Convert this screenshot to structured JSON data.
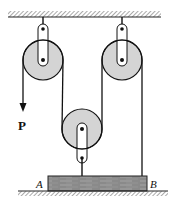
{
  "diagram": {
    "type": "pulley-system",
    "colors": {
      "pulley_fill": "#d4d4d4",
      "block_fill": "#8a8a8a",
      "rope": "#111111",
      "hatch": "#555555",
      "background": "#ffffff"
    },
    "labels": {
      "force": "P",
      "block_left_end": "A",
      "block_right_end": "B"
    },
    "components": {
      "ceiling": "fixed support (hatched)",
      "pulleys": [
        {
          "name": "left-fixed-pulley",
          "type": "fixed"
        },
        {
          "name": "right-fixed-pulley",
          "type": "fixed"
        },
        {
          "name": "lower-movable-pulley",
          "type": "movable"
        }
      ],
      "block": "beam AB resting on ground",
      "ground": "hatched floor"
    }
  }
}
